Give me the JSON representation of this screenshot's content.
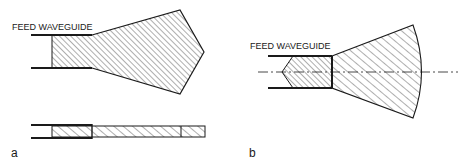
{
  "figure": {
    "panel_a": {
      "label": "a",
      "feed_label": "FEED WAVEGUIDE",
      "views": [
        "top-view-pentagonal-horn",
        "side-view-slab"
      ]
    },
    "panel_b": {
      "label": "b",
      "feed_label": "FEED WAVEGUIDE",
      "views": [
        "top-view-sectoral-horn-with-tapered-feed"
      ]
    },
    "colors": {
      "ink": "#1a1a1a",
      "background": "#ffffff"
    }
  }
}
